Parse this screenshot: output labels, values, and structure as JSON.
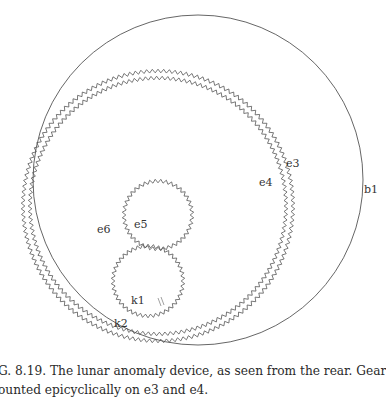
{
  "figure": {
    "circles": {
      "b1": {
        "cx": 198,
        "cy": 180,
        "r": 165
      },
      "ring_outer": {
        "cx": 158,
        "cy": 206,
        "r": 135,
        "teeth": 150
      },
      "ring_inner": {
        "cx": 158,
        "cy": 206,
        "r": 128,
        "teeth": 145
      },
      "e5": {
        "cx": 158,
        "cy": 215,
        "r": 34,
        "teeth": 40
      },
      "k1": {
        "cx": 148,
        "cy": 281,
        "r": 35,
        "teeth": 42
      }
    },
    "stroke_color": "#555555",
    "labels": {
      "b1": "b1",
      "e3": "e3",
      "e4": "e4",
      "e5": "e5",
      "e6": "e6",
      "k1": "k1",
      "k2": "k2"
    }
  },
  "caption": {
    "line1": "G. 8.19.  The lunar anomaly device, as seen from the rear. Gears k1 and k2 are",
    "line2": "ounted epicyclically on e3 and e4."
  }
}
